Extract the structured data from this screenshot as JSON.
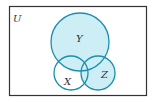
{
  "diagram": {
    "type": "venn",
    "universe_label": "U",
    "sets": [
      {
        "name": "Y",
        "label": "Y",
        "cx": 80,
        "cy": 42,
        "r": 29
      },
      {
        "name": "X",
        "label": "X",
        "cx": 71,
        "cy": 73,
        "r": 17
      },
      {
        "name": "Z",
        "label": "Z",
        "cx": 98,
        "cy": 73,
        "r": 17
      }
    ],
    "shaded_region": "Y ∪ Z",
    "colors": {
      "fill": "#cdeef5",
      "stroke": "#1b8fae",
      "frame": "#333333",
      "background": "#ffffff"
    }
  }
}
